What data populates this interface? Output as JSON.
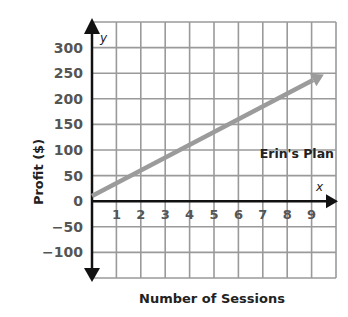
{
  "chart_data": {
    "type": "line",
    "title": "",
    "xlabel": "Number of Sessions",
    "ylabel": "Profit ($)",
    "x_axis_var": "x",
    "y_axis_var": "y",
    "x_ticks": [
      "1",
      "2",
      "3",
      "4",
      "5",
      "6",
      "7",
      "8",
      "9"
    ],
    "y_ticks": [
      "300",
      "250",
      "200",
      "150",
      "100",
      "50",
      "0",
      "−50",
      "−100"
    ],
    "xlim": [
      0,
      10
    ],
    "ylim": [
      -150,
      350
    ],
    "grid": true,
    "series": [
      {
        "name": "Erin's Plan",
        "x": [
          0,
          9.5
        ],
        "y": [
          10,
          247.5
        ],
        "color": "#999999"
      }
    ]
  },
  "colors": {
    "grid": "#9a9a9a",
    "axis": "#111111",
    "line": "#9b9b9b"
  }
}
